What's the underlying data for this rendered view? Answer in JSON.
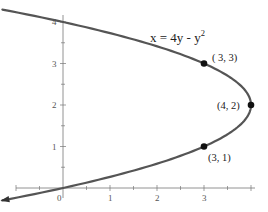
{
  "chart_data": {
    "type": "line",
    "title": "",
    "equation": "x = 4y - y",
    "equation_exponent": "2",
    "xlabel": "",
    "ylabel": "",
    "xlim": [
      -1,
      4
    ],
    "ylim": [
      -0.2,
      4.5
    ],
    "grid": false,
    "x_ticks": [
      "0",
      "1",
      "2",
      "3"
    ],
    "y_ticks": [
      "1",
      "2",
      "3",
      "4"
    ],
    "curve": {
      "name": "x = 4y - y^2",
      "y_range": [
        -0.3,
        4.3
      ],
      "color": "#555555"
    },
    "points": [
      {
        "x": 3,
        "y": 3,
        "label": "( 3, 3)"
      },
      {
        "x": 4,
        "y": 2,
        "label": "(4, 2)"
      },
      {
        "x": 3,
        "y": 1,
        "label": "(3, 1)"
      }
    ],
    "legend": null
  },
  "colors": {
    "axis": "#666666",
    "curve": "#555555",
    "point": "#111111",
    "text": "#222222"
  }
}
